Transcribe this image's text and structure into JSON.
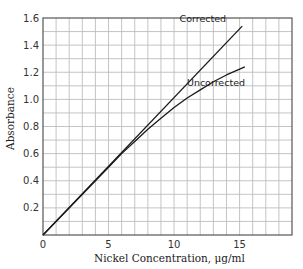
{
  "chart_data": {
    "type": "line",
    "title": "",
    "xlabel": "Nickel Concentration, μg/ml",
    "ylabel": "Absorbance",
    "xlim": [
      0,
      19
    ],
    "ylim": [
      0,
      1.6
    ],
    "x_ticks": [
      0,
      5,
      10,
      15
    ],
    "x_tick_labels": [
      "0",
      "5",
      "10",
      "15"
    ],
    "y_ticks": [
      0.2,
      0.4,
      0.6,
      0.8,
      1.0,
      1.2,
      1.4,
      1.6
    ],
    "y_tick_labels": [
      "0.2",
      "0.4",
      "0.6",
      "0.8",
      "1.0",
      "1.2",
      "1.4",
      "1.6"
    ],
    "grid": true,
    "grid_x_step": 1,
    "grid_y_step": 0.1,
    "legend": "none (inline labels)",
    "series": [
      {
        "name": "Corrected",
        "x": [
          0,
          15.2
        ],
        "y": [
          0,
          1.54
        ]
      },
      {
        "name": "Uncorrected",
        "x": [
          0,
          5,
          6,
          7,
          8,
          9,
          10,
          11,
          12,
          13,
          14,
          15.4
        ],
        "y": [
          0,
          0.5,
          0.6,
          0.69,
          0.78,
          0.86,
          0.94,
          1.01,
          1.07,
          1.13,
          1.18,
          1.24
        ]
      }
    ],
    "annotations": [
      {
        "text": "Corrected",
        "x": 12.2,
        "y": 1.57
      },
      {
        "text": "Uncorrected",
        "x": 13.2,
        "y": 1.1
      }
    ]
  }
}
